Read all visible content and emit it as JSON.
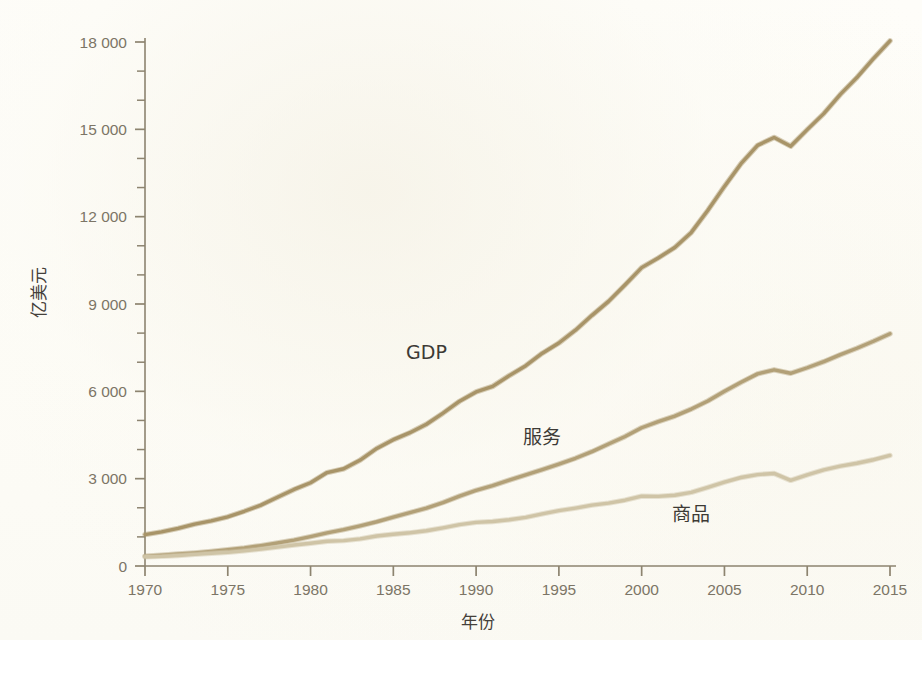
{
  "figure": {
    "background_color": "#fdfcf6",
    "page_color": "#ffffff"
  },
  "chart_data": {
    "type": "line",
    "title": "",
    "subtitle": "",
    "xlabel": "年份",
    "ylabel": "亿美元",
    "xlim": [
      1970,
      2015
    ],
    "ylim": [
      0,
      18000
    ],
    "grid": false,
    "legend_position": "inline-labels",
    "x_tick_labels": [
      "1970",
      "1975",
      "1980",
      "1985",
      "1990",
      "1995",
      "2000",
      "2005",
      "2010",
      "2015"
    ],
    "x_ticks": [
      1970,
      1975,
      1980,
      1985,
      1990,
      1995,
      2000,
      2005,
      2010,
      2015
    ],
    "y_tick_labels": [
      "0",
      "3 000",
      "6 000",
      "9 000",
      "12 000",
      "15 000",
      "18 000"
    ],
    "y_ticks": [
      0,
      3000,
      6000,
      9000,
      12000,
      15000,
      18000
    ],
    "y_minor_ticks": [
      1000,
      2000,
      4000,
      5000,
      7000,
      8000,
      10000,
      11000,
      13000,
      14000,
      16000,
      17000
    ],
    "x": [
      1970,
      1971,
      1972,
      1973,
      1974,
      1975,
      1976,
      1977,
      1978,
      1979,
      1980,
      1981,
      1982,
      1983,
      1984,
      1985,
      1986,
      1987,
      1988,
      1989,
      1990,
      1991,
      1992,
      1993,
      1994,
      1995,
      1996,
      1997,
      1998,
      1999,
      2000,
      2001,
      2002,
      2003,
      2004,
      2005,
      2006,
      2007,
      2008,
      2009,
      2010,
      2011,
      2012,
      2013,
      2014,
      2015
    ],
    "series": [
      {
        "name": "GDP",
        "label": "GDP",
        "color": "#a89468",
        "label_x": 1987,
        "label_y": 7100,
        "values": [
          1080,
          1170,
          1290,
          1440,
          1550,
          1690,
          1880,
          2090,
          2360,
          2630,
          2860,
          3210,
          3340,
          3640,
          4040,
          4340,
          4580,
          4870,
          5250,
          5660,
          5980,
          6170,
          6540,
          6880,
          7310,
          7660,
          8100,
          8610,
          9090,
          9660,
          10250,
          10580,
          10940,
          11460,
          12220,
          13040,
          13820,
          14450,
          14720,
          14420,
          14990,
          15540,
          16200,
          16780,
          17430,
          18040
        ]
      },
      {
        "name": "服务",
        "label": "服务",
        "color": "#b2a077",
        "label_x": 1994,
        "label_y": 4200,
        "values": [
          340,
          370,
          410,
          450,
          500,
          560,
          620,
          700,
          790,
          890,
          1010,
          1140,
          1250,
          1380,
          1520,
          1680,
          1830,
          1990,
          2180,
          2400,
          2600,
          2760,
          2950,
          3130,
          3310,
          3500,
          3700,
          3930,
          4190,
          4450,
          4750,
          4960,
          5150,
          5390,
          5670,
          6000,
          6310,
          6600,
          6740,
          6620,
          6810,
          7020,
          7260,
          7480,
          7720,
          7980
        ]
      },
      {
        "name": "商品",
        "label": "商品",
        "color": "#cfc4a6",
        "label_x": 2003,
        "label_y": 1550,
        "values": [
          320,
          330,
          360,
          400,
          440,
          470,
          520,
          580,
          650,
          720,
          780,
          850,
          870,
          930,
          1030,
          1090,
          1140,
          1210,
          1310,
          1420,
          1500,
          1530,
          1590,
          1670,
          1790,
          1900,
          1990,
          2090,
          2160,
          2260,
          2400,
          2390,
          2430,
          2530,
          2700,
          2880,
          3040,
          3140,
          3180,
          2940,
          3130,
          3300,
          3430,
          3530,
          3650,
          3800
        ]
      }
    ]
  }
}
